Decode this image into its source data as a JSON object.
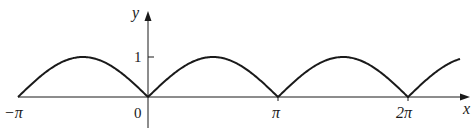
{
  "chart_data": {
    "type": "line",
    "title": "",
    "function": "y = |sin x|",
    "xlabel": "x",
    "ylabel": "y",
    "x_ticks": [
      {
        "value": -3.14159,
        "label": "−π"
      },
      {
        "value": 0,
        "label": "0"
      },
      {
        "value": 3.14159,
        "label": "π"
      },
      {
        "value": 6.28318,
        "label": "2π"
      }
    ],
    "y_ticks": [
      {
        "value": 1,
        "label": "1"
      }
    ],
    "xlim": [
      -3.14159,
      8.9
    ],
    "ylim": [
      -0.75,
      2.1
    ],
    "grid": false,
    "legend": null,
    "series": [
      {
        "name": "|sin x|",
        "x": [
          -3.14159,
          -2.35619,
          -1.5708,
          -0.7854,
          0,
          0.7854,
          1.5708,
          2.35619,
          3.14159,
          3.92699,
          4.71239,
          5.49779,
          6.28318,
          7.06858,
          7.54
        ],
        "values": [
          0,
          0.707,
          1,
          0.707,
          0,
          0.707,
          1,
          0.707,
          0,
          0.707,
          1,
          0.707,
          0,
          0.707,
          0.95
        ]
      }
    ],
    "color": "#1a1a1a"
  },
  "labels": {
    "x_axis": "x",
    "y_axis": "y",
    "neg_pi": "−π",
    "zero": "0",
    "pi": "π",
    "two_pi": "2π",
    "one": "1"
  }
}
